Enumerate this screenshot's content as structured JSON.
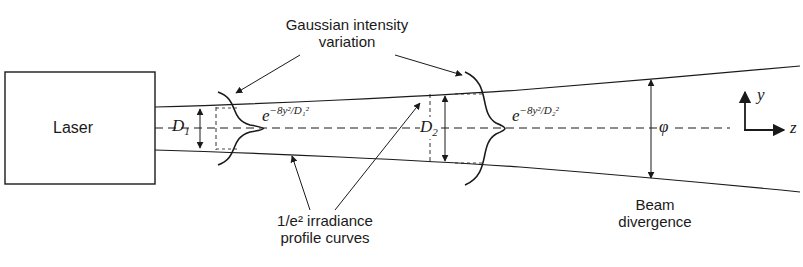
{
  "diagram": {
    "laser_box": {
      "label": "Laser"
    },
    "top_annotation": {
      "line1": "Gaussian intensity",
      "line2": "variation"
    },
    "bottom_annotation": {
      "line1": "1/e² irradiance",
      "line2": "profile curves"
    },
    "beam_divergence": {
      "line1": "Beam",
      "line2": "divergence"
    },
    "diameter_labels": {
      "d1": "D",
      "d1_sub": "1",
      "d2": "D",
      "d2_sub": "2"
    },
    "phi_label": "φ",
    "formula1": {
      "base": "e",
      "exponent": "−8y²/D₁²"
    },
    "formula2": {
      "base": "e",
      "exponent": "−8y²/D₂²"
    },
    "axes": {
      "y": "y",
      "z": "z"
    },
    "colors": {
      "stroke": "#1a1a1a",
      "background": "#ffffff"
    }
  }
}
